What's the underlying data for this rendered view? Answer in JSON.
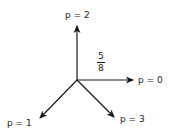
{
  "diagram": {
    "stroke_color": "#1a1a1a",
    "origin": {
      "x": 77,
      "y": 80
    },
    "arrows": [
      {
        "label": "p = 0",
        "direction": "right",
        "tip": {
          "x": 133,
          "y": 80
        }
      },
      {
        "label": "p = 1",
        "direction": "down-left",
        "tip": {
          "x": 40,
          "y": 118
        }
      },
      {
        "label": "p = 2",
        "direction": "up",
        "tip": {
          "x": 77,
          "y": 26
        }
      },
      {
        "label": "p = 3",
        "direction": "down-right",
        "tip": {
          "x": 114,
          "y": 117
        }
      }
    ],
    "annotation": {
      "numerator": "5",
      "denominator": "8"
    }
  }
}
